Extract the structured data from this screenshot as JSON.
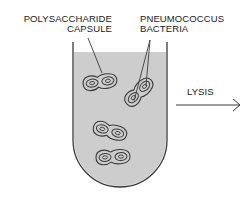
{
  "labels": {
    "capsule_line1": "POLYSACCHARIDE",
    "capsule_line2": "CAPSULE",
    "bacteria_line1": "PNEUMOCOCCUS",
    "bacteria_line2": "BACTERIA",
    "lysis": "LYSIS"
  },
  "colors": {
    "liquid": "#cfcfcf",
    "outline": "#3a3a3a",
    "text": "#1a1a1a"
  },
  "bacteria_pairs": [
    {
      "cx": 100,
      "cy": 82,
      "angle": -8
    },
    {
      "cx": 139,
      "cy": 92,
      "angle": -45
    },
    {
      "cx": 110,
      "cy": 130,
      "angle": 15
    },
    {
      "cx": 113,
      "cy": 157,
      "angle": -3
    }
  ]
}
